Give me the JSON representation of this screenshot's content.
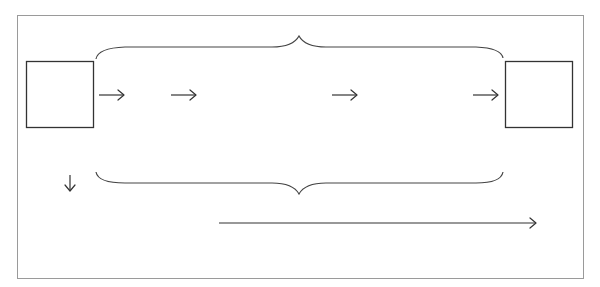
{
  "diagram": {
    "type": "commutative-diagram-skeleton",
    "frame": {
      "x": 17,
      "y": 15,
      "width": 567,
      "height": 264,
      "stroke": "#9a9a9a"
    },
    "nodes": [
      {
        "id": "left-box",
        "shape": "square",
        "x": 26,
        "y": 61,
        "width": 68,
        "height": 67,
        "label": ""
      },
      {
        "id": "right-box",
        "shape": "square",
        "x": 505,
        "y": 61,
        "width": 68,
        "height": 67,
        "label": ""
      }
    ],
    "braces": [
      {
        "id": "top-brace",
        "orientation": "up",
        "x1": 96,
        "x2": 503,
        "y": 47,
        "tip_y": 36,
        "tip_x": 299
      },
      {
        "id": "bottom-brace",
        "orientation": "down",
        "x1": 96,
        "x2": 503,
        "y": 183,
        "tip_y": 194,
        "tip_x": 299
      }
    ],
    "arrows": [
      {
        "id": "arrow-1",
        "direction": "right",
        "x1": 99,
        "x2": 124,
        "y": 95
      },
      {
        "id": "arrow-2",
        "direction": "right",
        "x1": 171,
        "x2": 196,
        "y": 95
      },
      {
        "id": "arrow-3",
        "direction": "right",
        "x1": 332,
        "x2": 357,
        "y": 95
      },
      {
        "id": "arrow-4",
        "direction": "right",
        "x1": 473,
        "x2": 498,
        "y": 95
      },
      {
        "id": "arrow-down",
        "direction": "down",
        "x": 70,
        "y1": 175,
        "y2": 191
      },
      {
        "id": "arrow-long",
        "direction": "right",
        "x1": 219,
        "x2": 536,
        "y": 223
      }
    ],
    "colors": {
      "frame": "#9a9a9a",
      "stroke": "#333333",
      "background": "#ffffff"
    }
  }
}
